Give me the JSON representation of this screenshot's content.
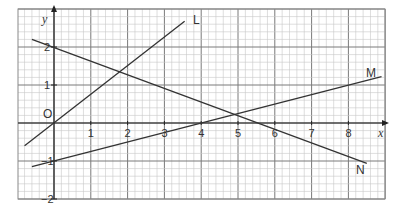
{
  "chart_data": {
    "type": "line",
    "title": "",
    "xlabel": "x",
    "ylabel": "y",
    "xlim": [
      -1,
      8.9
    ],
    "ylim": [
      -2,
      3
    ],
    "grid": true,
    "origin_label": "O",
    "x_ticks": [
      "1",
      "2",
      "3",
      "4",
      "5",
      "6",
      "7",
      "8"
    ],
    "y_ticks": [
      "2",
      "1",
      "-1",
      "-2"
    ],
    "series": [
      {
        "name": "L",
        "points": [
          [
            -0.8,
            -0.6
          ],
          [
            3.55,
            2.68
          ]
        ],
        "equation_approx": "y = 0.75x"
      },
      {
        "name": "M",
        "points": [
          [
            -0.6,
            -1.15
          ],
          [
            8.9,
            1.22
          ]
        ],
        "equation_approx": "y = 0.25x - 1"
      },
      {
        "name": "N",
        "points": [
          [
            -0.6,
            2.2
          ],
          [
            8.5,
            -1.06
          ]
        ],
        "equation_approx": "y = 2 - 0.36x"
      }
    ],
    "colors": {
      "grid_minor": "#c8c8c8",
      "grid_major": "#7a7a7a",
      "lines": "#333333"
    }
  }
}
